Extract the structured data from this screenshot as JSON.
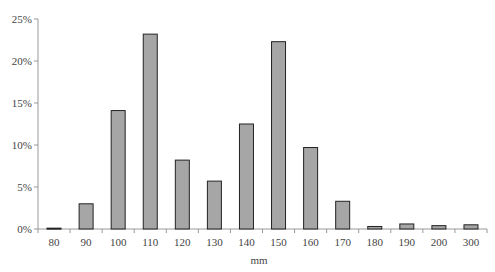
{
  "chart_data": {
    "type": "bar",
    "title": "",
    "xlabel": "mm",
    "ylabel": "",
    "categories": [
      "80",
      "90",
      "100",
      "110",
      "120",
      "130",
      "140",
      "150",
      "160",
      "170",
      "180",
      "190",
      "200",
      "300"
    ],
    "values": [
      0.1,
      3.0,
      14.1,
      23.2,
      8.2,
      5.7,
      12.5,
      22.3,
      9.7,
      3.3,
      0.3,
      0.6,
      0.4,
      0.5
    ],
    "ylim": [
      0,
      25
    ],
    "yticks": [
      "0%",
      "5%",
      "10%",
      "15%",
      "20%",
      "25%"
    ],
    "ytick_values": [
      0,
      5,
      10,
      15,
      20,
      25
    ],
    "grid": false,
    "legend": null,
    "bar_color": "#a6a6a6",
    "bar_edge_color": "#222222"
  }
}
